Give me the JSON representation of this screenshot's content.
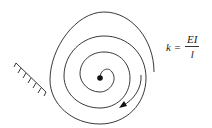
{
  "diagram": {
    "formula": {
      "lhs": "k =",
      "numerator": "EI",
      "denominator": "l"
    },
    "elements": [
      "spiral-spring",
      "fixed-wall-support",
      "center-pivot",
      "rotation-arrow"
    ],
    "colors": {
      "stroke": "#222222",
      "background": "#ffffff"
    }
  }
}
